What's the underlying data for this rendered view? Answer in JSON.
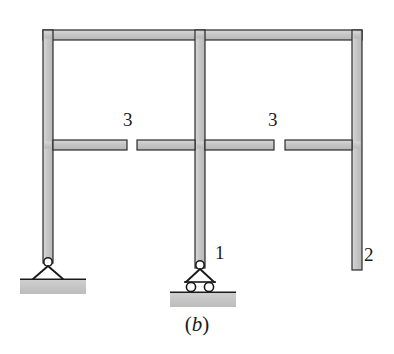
{
  "figure": {
    "caption_open": "(",
    "caption_letter": "b",
    "caption_close": ")",
    "caption_full": "(b)",
    "background_color": "#ffffff"
  },
  "style": {
    "member_fill": "#c9c9c9",
    "member_stroke": "#2b2b2b",
    "member_stroke_width": 1.2,
    "ground_fill": "#c2c2c2",
    "ground_stroke": "#2b2b2b",
    "support_stroke": "#1a1a1a",
    "label_color": "#1a1a1a",
    "member_thickness_px": 10
  },
  "labels": [
    {
      "id": "hinge-left",
      "text": "3",
      "x": 123,
      "y": 110,
      "meaning": "internal-hinge-release"
    },
    {
      "id": "hinge-right",
      "text": "3",
      "x": 268,
      "y": 110,
      "meaning": "internal-hinge-release"
    },
    {
      "id": "node-1",
      "text": "1",
      "x": 215,
      "y": 243,
      "meaning": "pin-on-rollers-support"
    },
    {
      "id": "node-2",
      "text": "2",
      "x": 364,
      "y": 245,
      "meaning": "free-end-right-column"
    }
  ],
  "members": {
    "top_beam": {
      "x1": 48,
      "y1": 35,
      "x2": 357,
      "y2": 35,
      "name": "top-beam"
    },
    "mid_beam_left": {
      "x1": 48,
      "y1": 145,
      "x2": 127,
      "y2": 145,
      "name": "mid-beam-left-segment"
    },
    "mid_beam_center_left": {
      "x1": 137,
      "y1": 145,
      "x2": 200,
      "y2": 145,
      "name": "mid-beam-center-left-segment"
    },
    "mid_beam_center_right": {
      "x1": 200,
      "y1": 145,
      "x2": 274,
      "y2": 145,
      "name": "mid-beam-center-right-segment"
    },
    "mid_beam_right": {
      "x1": 285,
      "y1": 145,
      "x2": 357,
      "y2": 145,
      "name": "mid-beam-right-segment"
    },
    "left_column": {
      "x1": 48,
      "y1": 35,
      "x2": 48,
      "y2": 258,
      "name": "left-column"
    },
    "center_column": {
      "x1": 200,
      "y1": 35,
      "x2": 200,
      "y2": 263,
      "name": "center-column"
    },
    "right_column": {
      "x1": 357,
      "y1": 35,
      "x2": 357,
      "y2": 265,
      "name": "right-column"
    }
  },
  "supports": [
    {
      "id": "support-left",
      "type": "pin",
      "label": "",
      "apex_x": 53,
      "apex_y": 262,
      "base_y": 279,
      "half_width": 17,
      "ground": {
        "x": 14,
        "y": 279,
        "width": 78,
        "height": 14
      }
    },
    {
      "id": "support-center",
      "type": "roller",
      "label": "1",
      "apex_x": 204,
      "apex_y": 265,
      "base_y": 282,
      "half_width": 17,
      "roller_radius": 5,
      "roller_count": 2,
      "ground": {
        "x": 164,
        "y": 292,
        "width": 78,
        "height": 14
      }
    }
  ],
  "hinges": [
    {
      "id": "hinge-gap-left",
      "gap_x1": 127,
      "gap_x2": 137,
      "y": 145,
      "label": "3"
    },
    {
      "id": "hinge-gap-right",
      "gap_x1": 274,
      "gap_x2": 285,
      "y": 145,
      "label": "3"
    }
  ],
  "free_ends": [
    {
      "id": "free-end-right-column",
      "x": 357,
      "y": 265,
      "label": "2"
    }
  ]
}
